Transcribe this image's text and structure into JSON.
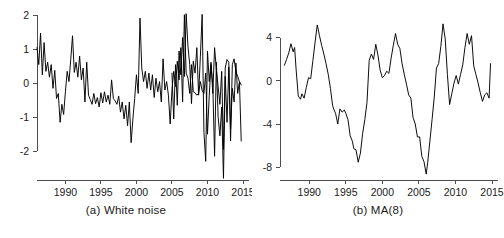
{
  "figure": {
    "background": "#ffffff",
    "line_color": "#000000",
    "axis_color": "#4d4d4d",
    "text_color": "#1a1a1a"
  },
  "panels": [
    {
      "key": "white_noise",
      "caption": "(a) White noise"
    },
    {
      "key": "ma8",
      "caption": "(b) MA(8)"
    }
  ],
  "chart_data": [
    {
      "type": "line",
      "title": "(a) White noise",
      "xlabel": "",
      "ylabel": "",
      "xlim": [
        1986.0,
        2015.0
      ],
      "ylim": [
        -2.85,
        2.1
      ],
      "xticks": [
        1990,
        1995,
        2000,
        2005,
        2010,
        2015
      ],
      "yticks": [
        -2,
        -1,
        0,
        1,
        2
      ],
      "xticklabels": [
        "1990",
        "1995",
        "2000",
        "2005",
        "2010",
        "2015"
      ],
      "yticklabels": [
        "-2",
        "-1",
        "0",
        "1",
        "2"
      ],
      "grid": false,
      "legend": "none",
      "series": [
        {
          "name": "white noise",
          "x": [
            1986.0,
            1986.25,
            1986.5,
            1986.75,
            1987.0,
            1987.25,
            1987.5,
            1987.75,
            1988.0,
            1988.25,
            1988.5,
            1988.75,
            1989.0,
            1989.25,
            1989.5,
            1989.75,
            1990.0,
            1990.25,
            1990.5,
            1990.75,
            1991.0,
            1991.25,
            1991.5,
            1991.75,
            1992.0,
            1992.25,
            1992.5,
            1992.75,
            1993.0,
            1993.25,
            1993.5,
            1993.75,
            1994.0,
            1994.25,
            1994.5,
            1994.75,
            1995.0,
            1995.25,
            1995.5,
            1995.75,
            1996.0,
            1996.25,
            1996.5,
            1996.75,
            1997.0,
            1997.25,
            1997.5,
            1997.75,
            1998.0,
            1998.25,
            1998.5,
            1998.75,
            1999.0,
            1999.25,
            1999.5,
            1999.75,
            2000.0,
            2000.25,
            2000.5,
            2000.75,
            2001.0,
            2001.25,
            2001.5,
            2001.75,
            2002.0,
            2002.25,
            2002.5,
            2002.75,
            2003.0,
            2003.25,
            2003.5,
            2003.75,
            2004.0,
            2004.25,
            2004.5,
            2004.75,
            2005.0,
            2005.25,
            2005.5,
            2005.75,
            2006.0,
            2006.25,
            2006.5,
            2006.75,
            2007.0,
            2007.25,
            2007.5,
            2007.75,
            2008.0,
            2008.25,
            2008.5,
            2008.75,
            2009.0,
            2009.25,
            2009.5,
            2009.75,
            2010.0,
            2010.25,
            2010.5,
            2010.75,
            2011.0,
            2011.25,
            2011.5,
            2011.75,
            2012.0,
            2012.25,
            2012.5,
            2012.75,
            2013.0,
            2013.25,
            2013.5,
            2013.75,
            2014.0,
            2014.25,
            2014.5,
            2014.75
          ],
          "y": [
            1.05,
            0.55,
            1.48,
            0.25,
            1.2,
            0.35,
            0.62,
            0.18,
            0.55,
            -0.15,
            0.38,
            -0.45,
            -0.3,
            -1.15,
            -0.62,
            -0.92,
            -0.25,
            0.35,
            0.05,
            0.7,
            1.4,
            0.32,
            0.62,
            0.18,
            0.8,
            0.1,
            0.45,
            -0.55,
            0.62,
            -0.35,
            -0.48,
            -0.62,
            -0.3,
            -0.6,
            -0.42,
            -0.7,
            -0.28,
            -0.58,
            -0.25,
            -0.55,
            -0.35,
            -0.62,
            0.1,
            -0.45,
            -0.52,
            -0.62,
            -0.38,
            -0.85,
            -0.55,
            -1.05,
            -0.65,
            -1.25,
            -0.55,
            -1.75,
            -1.05,
            -0.45,
            0.25,
            -0.3,
            1.92,
            0.45,
            0.05,
            0.35,
            -0.15,
            0.3,
            -0.2,
            0.25,
            -0.42,
            0.15,
            -0.25,
            0.05,
            -0.55,
            0.72,
            -0.2,
            0.05,
            -0.35,
            -1.2,
            -0.18,
            0.35,
            -0.1,
            0.65,
            0.1,
            1.05,
            -0.55,
            2.02,
            0.3,
            0.15,
            -0.3,
            0.55,
            -0.25,
            -0.28,
            -0.35,
            -0.3,
            0.05,
            -0.22,
            -0.3,
            0.3,
            -1.5,
            -0.35,
            0.55,
            -0.05,
            -2.15,
            0.62,
            -1.0,
            -1.55,
            -0.7,
            -2.8,
            0.2,
            -1.15,
            0.48,
            -1.35,
            -0.15,
            -0.55,
            0.6,
            -0.3,
            0.05,
            -1.7
          ]
        },
        {
          "name": "white noise (continued)",
          "x": [
            2005.0,
            2005.25,
            2005.5,
            2005.75,
            2006.0,
            2006.25,
            2006.5,
            2006.75,
            2007.0,
            2007.25,
            2007.5,
            2007.75,
            2008.0,
            2008.25,
            2008.5,
            2008.75,
            2009.0,
            2009.25,
            2009.5,
            2009.75,
            2010.0,
            2010.25,
            2010.5,
            2010.75,
            2011.0,
            2011.25,
            2011.5,
            2011.75,
            2012.0,
            2012.25,
            2012.5,
            2012.75,
            2013.0,
            2013.25,
            2013.5,
            2013.75,
            2014.0,
            2014.25,
            2014.5,
            2014.75
          ],
          "y": [
            0.3,
            -1.05,
            0.55,
            -0.65,
            0.95,
            0.25,
            1.35,
            0.2,
            2.05,
            1.1,
            0.55,
            -0.6,
            0.65,
            0.3,
            1.05,
            -0.35,
            0.8,
            2.03,
            -1.45,
            -2.3,
            0.95,
            0.05,
            0.62,
            -0.3,
            1.05,
            0.4,
            -0.1,
            -0.62,
            0.35,
            -1.95,
            0.45,
            0.7,
            0.62,
            -1.7,
            0.55,
            0.72,
            0.35,
            0.2,
            0.05,
            -0.05
          ]
        }
      ]
    },
    {
      "type": "line",
      "title": "(b) MA(8)",
      "xlabel": "",
      "ylabel": "",
      "xlim": [
        1986.0,
        2015.0
      ],
      "ylim": [
        -9.2,
        6.4
      ],
      "xticks": [
        1990,
        1995,
        2000,
        2005,
        2010,
        2015
      ],
      "yticks": [
        -8,
        -4,
        0,
        4
      ],
      "xticklabels": [
        "1990",
        "1995",
        "2000",
        "2005",
        "2010",
        "2015"
      ],
      "yticklabels": [
        "-8",
        "-4",
        "0",
        "4"
      ],
      "grid": false,
      "legend": "none",
      "series": [
        {
          "name": "MA(8)",
          "x": [
            1986.6,
            1986.9,
            1987.2,
            1987.5,
            1987.8,
            1988.0,
            1988.2,
            1988.5,
            1988.8,
            1989.0,
            1989.3,
            1989.6,
            1989.9,
            1990.2,
            1990.5,
            1990.8,
            1991.1,
            1991.4,
            1991.7,
            1992.0,
            1992.3,
            1992.6,
            1992.9,
            1993.2,
            1993.4,
            1993.6,
            1993.9,
            1994.2,
            1994.5,
            1994.8,
            1995.0,
            1995.3,
            1995.6,
            1995.9,
            1996.1,
            1996.4,
            1996.7,
            1997.0,
            1997.3,
            1997.6,
            1997.9,
            1998.2,
            1998.5,
            1998.8,
            1999.1,
            1999.4,
            1999.7,
            2000.0,
            2000.3,
            2000.6,
            2000.9,
            2001.2,
            2001.5,
            2001.8,
            2002.1,
            2002.4,
            2002.7,
            2003.0,
            2003.3,
            2003.6,
            2003.9,
            2004.2,
            2004.5,
            2004.8,
            2005.1,
            2005.4,
            2005.7,
            2006.0,
            2006.2,
            2006.5,
            2006.8,
            2007.1,
            2007.4,
            2007.7,
            2008.0,
            2008.3,
            2008.6,
            2008.9,
            2009.2,
            2009.5,
            2009.8,
            2010.1,
            2010.4,
            2010.7,
            2011.0,
            2011.3,
            2011.6,
            2011.9,
            2012.2,
            2012.5,
            2012.8,
            2013.1,
            2013.4,
            2013.7,
            2014.0,
            2014.3,
            2014.6,
            2014.8
          ],
          "y": [
            1.45,
            2.0,
            2.6,
            3.45,
            2.7,
            3.1,
            1.1,
            -1.4,
            -1.7,
            -1.2,
            -1.6,
            -0.6,
            0.3,
            0.2,
            1.9,
            3.6,
            5.2,
            4.2,
            3.3,
            2.5,
            1.6,
            0.6,
            -0.7,
            -2.3,
            -2.7,
            -3.0,
            -4.0,
            -2.6,
            -2.9,
            -2.7,
            -3.0,
            -3.6,
            -5.1,
            -5.6,
            -6.3,
            -6.4,
            -7.55,
            -6.7,
            -4.9,
            -3.6,
            -2.0,
            1.9,
            2.5,
            2.0,
            3.4,
            2.4,
            1.0,
            0.3,
            0.5,
            0.9,
            0.7,
            2.1,
            3.3,
            4.4,
            3.4,
            3.0,
            1.6,
            0.6,
            -0.3,
            -1.3,
            -1.6,
            -3.4,
            -4.0,
            -5.2,
            -5.2,
            -7.0,
            -7.5,
            -8.65,
            -7.6,
            -5.6,
            -3.6,
            -1.5,
            1.2,
            1.6,
            3.2,
            5.3,
            3.9,
            0.6,
            -2.2,
            -1.2,
            -0.2,
            0.5,
            -0.3,
            0.6,
            1.5,
            3.1,
            4.4,
            3.4,
            4.2,
            1.4,
            0.6,
            -0.2,
            -1.1,
            -1.9,
            -1.3,
            -1.1,
            -1.6,
            1.6
          ]
        }
      ]
    }
  ]
}
